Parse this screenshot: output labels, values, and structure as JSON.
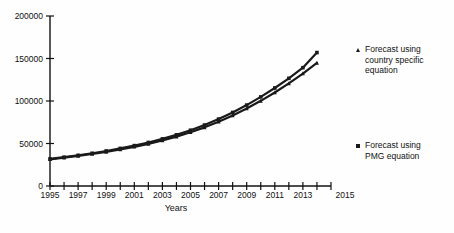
{
  "chart_data": {
    "type": "line",
    "title": "",
    "xlabel": "Years",
    "ylabel": "",
    "xlim": [
      1995,
      2015
    ],
    "ylim": [
      0,
      200000
    ],
    "grid": false,
    "legend_position": "right",
    "y_ticks": [
      0,
      50000,
      100000,
      150000,
      200000
    ],
    "y_tick_labels": [
      "0",
      "50000",
      "100000",
      "150000",
      "200000"
    ],
    "x_ticks": [
      1995,
      1996,
      1997,
      1998,
      1999,
      2000,
      2001,
      2002,
      2003,
      2004,
      2005,
      2006,
      2007,
      2008,
      2009,
      2010,
      2011,
      2012,
      2013,
      2014,
      2015
    ],
    "x_tick_labels": [
      "1995",
      "",
      "1997",
      "",
      "1999",
      "",
      "2001",
      "",
      "2003",
      "",
      "2005",
      "",
      "2007",
      "",
      "2009",
      "",
      "2011",
      "",
      "2013",
      "",
      "2015"
    ],
    "x": [
      1995,
      1996,
      1997,
      1998,
      1999,
      2000,
      2001,
      2002,
      2003,
      2004,
      2005,
      2006,
      2007,
      2008,
      2009,
      2010,
      2011,
      2012,
      2013,
      2014
    ],
    "series": [
      {
        "name": "Forecast using country specific equation",
        "marker": "triangle",
        "color": "#1a1a1a",
        "values": [
          31400,
          33300,
          35400,
          37700,
          40200,
          43000,
          46100,
          49600,
          53600,
          58100,
          63200,
          69000,
          75600,
          83000,
          91200,
          100200,
          110000,
          120700,
          132300,
          144900
        ]
      },
      {
        "name": "Forecast using PMG equation",
        "marker": "square",
        "color": "#1a1a1a",
        "values": [
          31900,
          33900,
          36100,
          38500,
          41200,
          44200,
          47500,
          51200,
          55400,
          60200,
          65600,
          71700,
          78700,
          86500,
          95200,
          104800,
          115300,
          126700,
          139200,
          157000
        ]
      }
    ]
  },
  "legend": {
    "entries": [
      {
        "label": "Forecast using\ncountry specific\nequation",
        "marker": "triangle"
      },
      {
        "label": "Forecast using\nPMG equation",
        "marker": "square"
      }
    ]
  }
}
